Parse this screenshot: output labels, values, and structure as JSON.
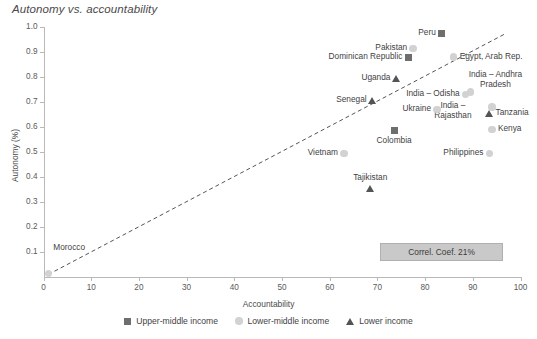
{
  "chart_data": {
    "type": "scatter",
    "title": "Autonomy vs. accountability",
    "xlabel": "Accountability",
    "ylabel": "Autonomy (%)",
    "xlim": [
      0,
      100
    ],
    "ylim": [
      0,
      1.0
    ],
    "xticks": [
      0,
      10,
      20,
      30,
      40,
      50,
      60,
      70,
      80,
      90,
      100
    ],
    "xtick_labels": [
      "0",
      "10",
      "20",
      "30",
      "40",
      "50",
      "60",
      "70",
      "80",
      "90",
      "100"
    ],
    "yticks": [
      0.1,
      0.2,
      0.3,
      0.4,
      0.5,
      0.6,
      0.7,
      0.8,
      0.9,
      1.0
    ],
    "ytick_labels": [
      "0.1",
      "0.2",
      "0.3",
      "0.4",
      "0.5",
      "0.6",
      "0.7",
      "0.8",
      "0.9",
      "1.0"
    ],
    "grid": false,
    "legend_position": "bottom",
    "annotation": "Correl. Coef. 21%",
    "trendline": {
      "style": "dashed",
      "x0": 1,
      "y0": 0.01,
      "x1": 97,
      "y1": 0.975
    },
    "series": [
      {
        "name": "Upper-middle income",
        "marker": "square",
        "color": "#6e6e6e",
        "points": [
          {
            "label": "Peru",
            "x": 83.5,
            "y": 0.975,
            "label_pos": "left"
          },
          {
            "label": "Dominican Republic",
            "x": 76.5,
            "y": 0.88,
            "label_pos": "left"
          },
          {
            "label": "Colombia",
            "x": 73.5,
            "y": 0.585,
            "label_pos": "below"
          }
        ]
      },
      {
        "name": "Lower-middle income",
        "marker": "circle",
        "color": "#d2d2d2",
        "points": [
          {
            "label": "Pakistan",
            "x": 77.5,
            "y": 0.915,
            "label_pos": "left"
          },
          {
            "label": "Egypt, Arab Rep.",
            "x": 86,
            "y": 0.88,
            "label_pos": "right"
          },
          {
            "label": "India – Andhra Pradesh",
            "x": 89.5,
            "y": 0.74,
            "label_pos": "above-right"
          },
          {
            "label": "India – Odisha",
            "x": 88.5,
            "y": 0.73,
            "label_pos": "left"
          },
          {
            "label": "India – Rajasthan",
            "x": 94,
            "y": 0.68,
            "label_pos": "left"
          },
          {
            "label": "Ukraine",
            "x": 82.5,
            "y": 0.67,
            "label_pos": "left"
          },
          {
            "label": "Kenya",
            "x": 94,
            "y": 0.59,
            "label_pos": "right"
          },
          {
            "label": "Philippines",
            "x": 93.5,
            "y": 0.495,
            "label_pos": "left"
          },
          {
            "label": "Vietnam",
            "x": 63,
            "y": 0.495,
            "label_pos": "left"
          },
          {
            "label": "Morocco",
            "x": 1,
            "y": 0.015,
            "label_pos": "right"
          }
        ]
      },
      {
        "name": "Lower income",
        "marker": "triangle",
        "color": "#545454",
        "points": [
          {
            "label": "Uganda",
            "x": 74,
            "y": 0.795,
            "label_pos": "left"
          },
          {
            "label": "Senegal",
            "x": 69,
            "y": 0.705,
            "label_pos": "left"
          },
          {
            "label": "Tanzania",
            "x": 93.5,
            "y": 0.655,
            "label_pos": "right"
          },
          {
            "label": "Tajikistan",
            "x": 68.5,
            "y": 0.355,
            "label_pos": "above"
          }
        ]
      }
    ]
  },
  "legend": {
    "items": [
      {
        "label": "Upper-middle income",
        "marker": "square",
        "color": "#6e6e6e"
      },
      {
        "label": "Lower-middle income",
        "marker": "circle",
        "color": "#d2d2d2"
      },
      {
        "label": "Lower income",
        "marker": "triangle",
        "color": "#545454"
      }
    ]
  }
}
